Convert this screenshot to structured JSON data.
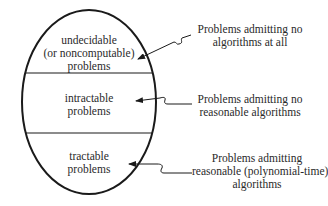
{
  "diagram": {
    "type": "nested-classification",
    "regions": [
      {
        "id": "undecidable",
        "lines": [
          "undecidable",
          "(or noncomputable)",
          "problems"
        ]
      },
      {
        "id": "intractable",
        "lines": [
          "intractable",
          "problems"
        ]
      },
      {
        "id": "tractable",
        "lines": [
          "tractable",
          "problems"
        ]
      }
    ],
    "annotations": [
      {
        "target": "undecidable",
        "lines": [
          "Problems admitting no",
          "algorithms at all"
        ]
      },
      {
        "target": "intractable",
        "lines": [
          "Problems admitting no",
          "reasonable algorithms"
        ]
      },
      {
        "target": "tractable",
        "lines": [
          "Problems admitting",
          "reasonable (polynomial-time)",
          "algorithms"
        ]
      }
    ],
    "colors": {
      "stroke": "#1a1a1a",
      "text": "#2a2a2a",
      "background": "#ffffff"
    }
  }
}
